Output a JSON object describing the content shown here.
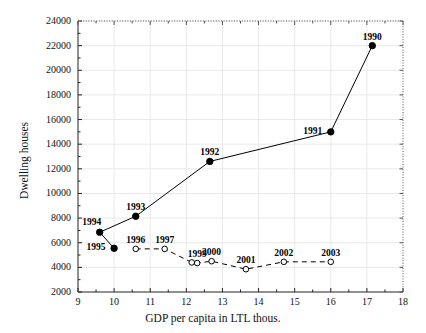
{
  "chart_data": {
    "type": "scatter",
    "title": "",
    "xlabel": "GDP per capita in LTL thous.",
    "ylabel": "Dwelling houses",
    "xlim": [
      9,
      18
    ],
    "ylim": [
      2000,
      24000
    ],
    "xticks": [
      9,
      10,
      11,
      12,
      13,
      14,
      15,
      16,
      17,
      18
    ],
    "yticks": [
      2000,
      4000,
      6000,
      8000,
      10000,
      12000,
      14000,
      16000,
      18000,
      20000,
      22000,
      24000
    ],
    "xtick_labels": [
      "9",
      "10",
      "11",
      "12",
      "13",
      "14",
      "15",
      "16",
      "17",
      "18"
    ],
    "ytick_labels": [
      "2000",
      "4000",
      "6000",
      "8000",
      "10000",
      "12000",
      "14000",
      "16000",
      "18000",
      "20000",
      "22000",
      "24000"
    ],
    "grid": true,
    "legend": "none",
    "series": [
      {
        "name": "1990-1995",
        "style": "solid",
        "marker": "filled-circle",
        "color": "#000000",
        "points": [
          {
            "label": "1990",
            "x": 17.15,
            "y": 22000,
            "label_pos": "above"
          },
          {
            "label": "1991",
            "x": 16.0,
            "y": 15000,
            "label_pos": "left"
          },
          {
            "label": "1992",
            "x": 12.65,
            "y": 12600,
            "label_pos": "above"
          },
          {
            "label": "1993",
            "x": 10.6,
            "y": 8150,
            "label_pos": "above"
          },
          {
            "label": "1994",
            "x": 9.6,
            "y": 6850,
            "label_pos": "above-left"
          },
          {
            "label": "1995",
            "x": 10.0,
            "y": 5550,
            "label_pos": "left"
          }
        ],
        "path_order": [
          "1995",
          "1994",
          "1993",
          "1992",
          "1991",
          "1990"
        ]
      },
      {
        "name": "1996-2003",
        "style": "dashed",
        "marker": "open-circle",
        "color": "#000000",
        "points": [
          {
            "label": "1996",
            "x": 10.6,
            "y": 5500,
            "label_pos": "above"
          },
          {
            "label": "1997",
            "x": 11.4,
            "y": 5500,
            "label_pos": "above"
          },
          {
            "label": "",
            "x": 12.15,
            "y": 4400,
            "label_pos": "none"
          },
          {
            "label": "1999",
            "x": 12.3,
            "y": 4350,
            "label_pos": "above"
          },
          {
            "label": "2000",
            "x": 12.7,
            "y": 4500,
            "label_pos": "above"
          },
          {
            "label": "2001",
            "x": 13.65,
            "y": 3850,
            "label_pos": "above"
          },
          {
            "label": "2002",
            "x": 14.7,
            "y": 4450,
            "label_pos": "above"
          },
          {
            "label": "2003",
            "x": 16.0,
            "y": 4450,
            "label_pos": "above"
          }
        ],
        "path_order": [
          "1996",
          "1997",
          "1998",
          "1999",
          "2000",
          "2001",
          "2002",
          "2003"
        ]
      }
    ]
  }
}
